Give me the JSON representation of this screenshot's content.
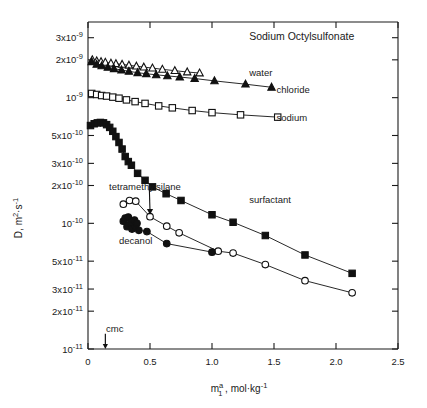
{
  "chart_data": {
    "type": "scatter",
    "title": "Sodium Octylsulfonate",
    "xlabel": "m₁ᵃ , mol·kg⁻¹",
    "ylabel": "D, m²·s⁻¹",
    "xlim": [
      0,
      2.5
    ],
    "ylim": [
      1e-11,
      4e-09
    ],
    "yscale": "log",
    "xscale": "linear",
    "grid": false,
    "legend_position": "inline-annotations",
    "xticks": [
      0,
      0.5,
      1.0,
      1.5,
      2.0,
      2.5
    ],
    "xticklabels": [
      "0",
      "0.5",
      "1.0",
      "1.5",
      "2.0",
      "2.5"
    ],
    "yticks": [
      3e-09,
      2e-09,
      1e-09,
      5e-10,
      3e-10,
      2e-10,
      1e-10,
      5e-11,
      3e-11,
      2e-11,
      1e-11
    ],
    "yticklabels": [
      "3x10⁻⁹",
      "2x10⁻⁹",
      "10⁻⁹",
      "5x10⁻¹⁰",
      "3x10⁻¹⁰",
      "2x10⁻¹⁰",
      "10⁻¹⁰",
      "5x10⁻¹¹",
      "3x10⁻¹¹",
      "2x10⁻¹¹",
      "10⁻¹¹"
    ],
    "annotations": [
      {
        "text": "water",
        "x": 1.3,
        "y": 1.6e-09,
        "name": "series-label-water"
      },
      {
        "text": "chloride",
        "x": 1.52,
        "y": 1.17e-09,
        "name": "series-label-chloride"
      },
      {
        "text": "sodium",
        "x": 1.52,
        "y": 7e-10,
        "name": "series-label-sodium"
      },
      {
        "text": "surfactant",
        "x": 1.3,
        "y": 1.55e-10,
        "name": "series-label-surfactant"
      },
      {
        "text": "tetramethylsilane",
        "x": 0.17,
        "y": 1.95e-10,
        "name": "series-label-tetramethylsilane"
      },
      {
        "text": "decanol",
        "x": 0.25,
        "y": 7.3e-11,
        "name": "series-label-decanol"
      },
      {
        "text": "cmc",
        "x": 0.145,
        "y": 1.45e-11,
        "name": "cmc-label"
      }
    ],
    "cmc": {
      "value": 0.14,
      "label": "cmc"
    },
    "series": [
      {
        "name": "water",
        "marker": "open-triangle",
        "color": "#111111",
        "points": [
          [
            0.035,
            2e-09
          ],
          [
            0.07,
            1.96e-09
          ],
          [
            0.105,
            1.93e-09
          ],
          [
            0.14,
            1.91e-09
          ],
          [
            0.185,
            1.88e-09
          ],
          [
            0.225,
            1.86e-09
          ],
          [
            0.275,
            1.84e-09
          ],
          [
            0.33,
            1.81e-09
          ],
          [
            0.39,
            1.78e-09
          ],
          [
            0.45,
            1.75e-09
          ],
          [
            0.52,
            1.72e-09
          ],
          [
            0.6,
            1.68e-09
          ],
          [
            0.7,
            1.64e-09
          ],
          [
            0.8,
            1.6e-09
          ],
          [
            0.9,
            1.57e-09
          ]
        ]
      },
      {
        "name": "chloride",
        "marker": "filled-triangle",
        "color": "#111111",
        "points": [
          [
            0.03,
            1.93e-09
          ],
          [
            0.07,
            1.84e-09
          ],
          [
            0.11,
            1.79e-09
          ],
          [
            0.16,
            1.74e-09
          ],
          [
            0.21,
            1.7e-09
          ],
          [
            0.27,
            1.66e-09
          ],
          [
            0.33,
            1.62e-09
          ],
          [
            0.4,
            1.58e-09
          ],
          [
            0.47,
            1.55e-09
          ],
          [
            0.55,
            1.52e-09
          ],
          [
            0.64,
            1.49e-09
          ],
          [
            0.74,
            1.46e-09
          ],
          [
            0.86,
            1.42e-09
          ],
          [
            1.02,
            1.36e-09
          ],
          [
            1.27,
            1.28e-09
          ],
          [
            1.48,
            1.21e-09
          ]
        ]
      },
      {
        "name": "sodium",
        "marker": "open-square",
        "color": "#111111",
        "points": [
          [
            0.03,
            1.08e-09
          ],
          [
            0.07,
            1.06e-09
          ],
          [
            0.11,
            1.04e-09
          ],
          [
            0.15,
            1.03e-09
          ],
          [
            0.2,
            1.01e-09
          ],
          [
            0.25,
            9.9e-10
          ],
          [
            0.31,
            9.6e-10
          ],
          [
            0.38,
            9.3e-10
          ],
          [
            0.46,
            9e-10
          ],
          [
            0.57,
            8.6e-10
          ],
          [
            0.68,
            8.3e-10
          ],
          [
            0.84,
            7.9e-10
          ],
          [
            1.0,
            7.6e-10
          ],
          [
            1.23,
            7.3e-10
          ],
          [
            1.53,
            7e-10
          ]
        ]
      },
      {
        "name": "surfactant",
        "marker": "filled-square",
        "color": "#111111",
        "points": [
          [
            0.02,
            6e-10
          ],
          [
            0.05,
            6.2e-10
          ],
          [
            0.075,
            6.3e-10
          ],
          [
            0.1,
            6.35e-10
          ],
          [
            0.125,
            6.3e-10
          ],
          [
            0.15,
            6.1e-10
          ],
          [
            0.175,
            5.8e-10
          ],
          [
            0.2,
            5.4e-10
          ],
          [
            0.225,
            4.9e-10
          ],
          [
            0.25,
            4.4e-10
          ],
          [
            0.275,
            3.9e-10
          ],
          [
            0.3,
            3.4e-10
          ],
          [
            0.325,
            3.1e-10
          ],
          [
            0.35,
            2.9e-10
          ],
          [
            0.4,
            2.5e-10
          ],
          [
            0.46,
            2.2e-10
          ],
          [
            0.52,
            1.95e-10
          ],
          [
            0.63,
            1.72e-10
          ],
          [
            0.75,
            1.52e-10
          ],
          [
            1.0,
            1.17e-10
          ],
          [
            1.17,
            1.02e-10
          ],
          [
            1.43,
            8e-11
          ],
          [
            1.75,
            5.6e-11
          ],
          [
            2.13,
            4e-11
          ]
        ]
      },
      {
        "name": "tetramethylsilane",
        "marker": "open-circle",
        "color": "#111111",
        "points": [
          [
            0.285,
            1.42e-10
          ],
          [
            0.335,
            1.52e-10
          ],
          [
            0.385,
            1.5e-10
          ],
          [
            0.5,
            1.13e-10
          ],
          [
            0.635,
            9.5e-11
          ],
          [
            0.735,
            8.4e-11
          ],
          [
            1.05,
            6e-11
          ],
          [
            1.17,
            5.8e-11
          ],
          [
            1.43,
            4.7e-11
          ],
          [
            1.75,
            3.5e-11
          ],
          [
            2.13,
            2.8e-11
          ]
        ]
      },
      {
        "name": "decanol",
        "marker": "filled-circle",
        "color": "#111111",
        "points": [
          [
            0.285,
            1.04e-10
          ],
          [
            0.3,
            1.1e-10
          ],
          [
            0.315,
            9.4e-11
          ],
          [
            0.325,
            1.12e-10
          ],
          [
            0.345,
            1e-10
          ],
          [
            0.355,
            9e-11
          ],
          [
            0.375,
            1.06e-10
          ],
          [
            0.385,
            9.4e-11
          ],
          [
            0.395,
            1e-10
          ],
          [
            0.41,
            8.8e-11
          ],
          [
            0.475,
            8.6e-11
          ],
          [
            0.635,
            6.9e-11
          ],
          [
            1.0,
            5.9e-11
          ]
        ]
      }
    ]
  }
}
